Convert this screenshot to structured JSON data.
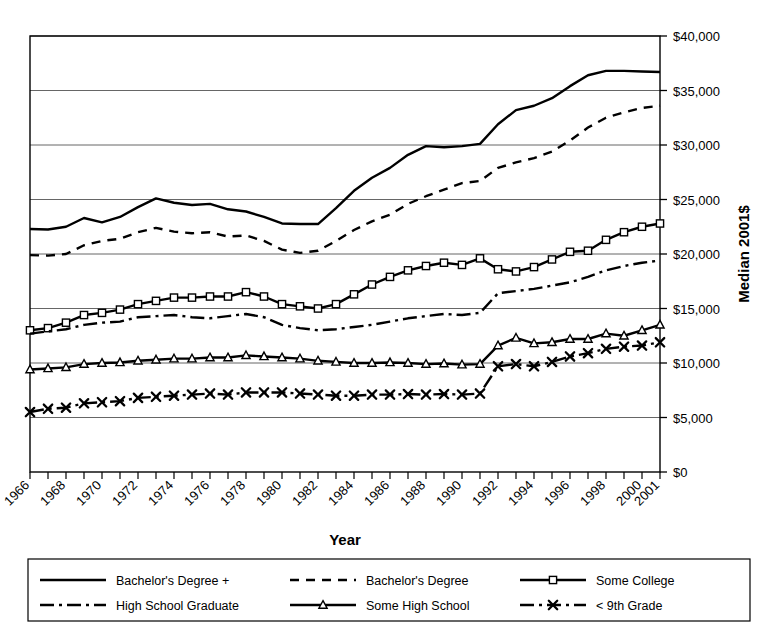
{
  "chart_data": {
    "type": "line",
    "title": "",
    "xlabel": "Year",
    "ylabel": "Median 2001$",
    "xlim": [
      1966,
      2001
    ],
    "ylim": [
      0,
      40000
    ],
    "grid": true,
    "legend_position": "bottom",
    "y_ticks": [
      0,
      5000,
      10000,
      15000,
      20000,
      25000,
      30000,
      35000,
      40000
    ],
    "y_tick_labels": [
      "$0",
      "$5,000",
      "$10,000",
      "$15,000",
      "$20,000",
      "$25,000",
      "$30,000",
      "$35,000",
      "$40,000"
    ],
    "x": [
      1966,
      1967,
      1968,
      1969,
      1970,
      1971,
      1972,
      1973,
      1974,
      1975,
      1976,
      1977,
      1978,
      1979,
      1980,
      1981,
      1982,
      1983,
      1984,
      1985,
      1986,
      1987,
      1988,
      1989,
      1990,
      1991,
      1992,
      1993,
      1994,
      1995,
      1996,
      1997,
      1998,
      1999,
      2000,
      2001
    ],
    "x_tick_labels": [
      "1966",
      "1968",
      "1970",
      "1972",
      "1974",
      "1976",
      "1978",
      "1980",
      "1982",
      "1984",
      "1986",
      "1988",
      "1990",
      "1992",
      "1994",
      "1996",
      "1998",
      "2000",
      "2001"
    ],
    "x_ticks": [
      1966,
      1968,
      1970,
      1972,
      1974,
      1976,
      1978,
      1980,
      1982,
      1984,
      1986,
      1988,
      1990,
      1992,
      1994,
      1996,
      1998,
      2000,
      2001
    ],
    "series": [
      {
        "name": "Bachelor's Degree +",
        "style": "solid",
        "marker": "none",
        "color": "#000000",
        "values": [
          22300,
          22250,
          22500,
          23300,
          22900,
          23400,
          24300,
          25100,
          24700,
          24500,
          24600,
          24100,
          23900,
          23400,
          22800,
          22750,
          22750,
          24200,
          25800,
          27000,
          27900,
          29100,
          29900,
          29800,
          29900,
          30100,
          31900,
          33200,
          33600,
          34300,
          35400,
          36400,
          36800,
          36800,
          36750,
          36700
        ]
      },
      {
        "name": "Bachelor's Degree",
        "style": "dashed",
        "marker": "none",
        "color": "#000000",
        "values": [
          19900,
          19850,
          20000,
          20800,
          21200,
          21400,
          22000,
          22400,
          22050,
          21900,
          22000,
          21600,
          21700,
          21200,
          20400,
          20100,
          20300,
          21200,
          22200,
          23000,
          23600,
          24600,
          25300,
          25900,
          26500,
          26700,
          27900,
          28400,
          28800,
          29400,
          30400,
          31600,
          32500,
          33000,
          33400,
          33600
        ]
      },
      {
        "name": "Some College",
        "style": "solid",
        "marker": "square",
        "color": "#000000",
        "values": [
          13000,
          13200,
          13700,
          14400,
          14600,
          14900,
          15400,
          15700,
          16000,
          16000,
          16100,
          16100,
          16500,
          16100,
          15400,
          15200,
          15000,
          15400,
          16300,
          17200,
          17900,
          18500,
          18900,
          19200,
          19000,
          19600,
          18600,
          18400,
          18800,
          19500,
          20200,
          20300,
          21300,
          22000,
          22500,
          22800
        ]
      },
      {
        "name": "High School Graduate",
        "style": "dashdot",
        "marker": "none",
        "color": "#000000",
        "values": [
          12700,
          12900,
          13100,
          13500,
          13700,
          13800,
          14200,
          14300,
          14400,
          14200,
          14100,
          14300,
          14500,
          14200,
          13500,
          13200,
          13000,
          13100,
          13300,
          13500,
          13800,
          14100,
          14300,
          14500,
          14400,
          14600,
          16400,
          16600,
          16800,
          17100,
          17400,
          17900,
          18500,
          18900,
          19200,
          19400
        ]
      },
      {
        "name": "Some High School",
        "style": "solid",
        "marker": "triangle",
        "color": "#000000",
        "values": [
          9400,
          9500,
          9600,
          9900,
          10000,
          10050,
          10200,
          10300,
          10400,
          10400,
          10500,
          10500,
          10700,
          10600,
          10500,
          10400,
          10200,
          10100,
          10000,
          10000,
          10050,
          10000,
          9900,
          9950,
          9850,
          9900,
          11600,
          12300,
          11800,
          11900,
          12200,
          12200,
          12700,
          12500,
          13000,
          13500
        ]
      },
      {
        "name": "< 9th Grade",
        "style": "dashdot",
        "marker": "x",
        "color": "#000000",
        "values": [
          5500,
          5800,
          5900,
          6300,
          6400,
          6500,
          6800,
          6900,
          7000,
          7100,
          7200,
          7100,
          7300,
          7300,
          7300,
          7200,
          7100,
          7000,
          7000,
          7100,
          7100,
          7150,
          7100,
          7150,
          7100,
          7200,
          9700,
          9900,
          9700,
          10100,
          10600,
          10900,
          11300,
          11500,
          11600,
          11900
        ]
      }
    ],
    "legend": [
      {
        "label": "Bachelor's Degree +",
        "style": "solid",
        "marker": "none"
      },
      {
        "label": "Bachelor's Degree",
        "style": "dashed",
        "marker": "none"
      },
      {
        "label": "Some College",
        "style": "solid",
        "marker": "square"
      },
      {
        "label": "High School Graduate",
        "style": "dashdot",
        "marker": "none"
      },
      {
        "label": "Some High School",
        "style": "solid",
        "marker": "triangle"
      },
      {
        "label": "< 9th Grade",
        "style": "dashdot",
        "marker": "x"
      }
    ]
  }
}
